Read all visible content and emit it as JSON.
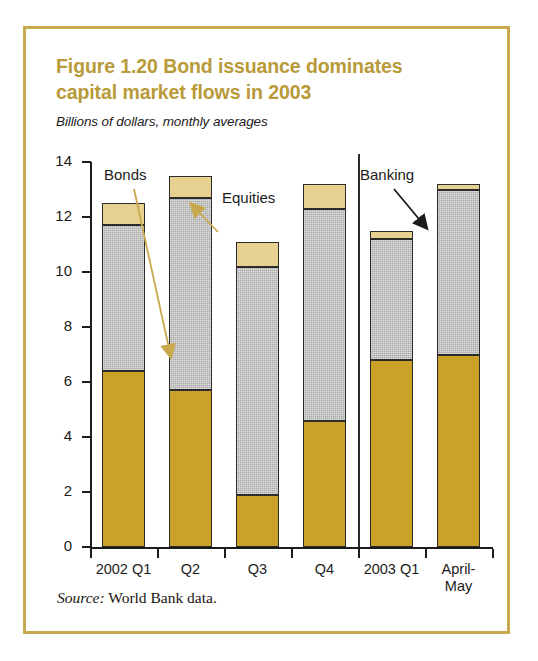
{
  "figure": {
    "title": "Figure 1.20  Bond issuance dominates capital market flows in 2003",
    "title_line1": "Figure 1.20  Bond issuance dominates",
    "title_line2": "capital market flows in 2003",
    "subtitle": "Billions of dollars, monthly averages",
    "source_label": "Source:",
    "source_text": "World Bank data."
  },
  "colors": {
    "title": "#b89a39",
    "frame": "#c8a94e",
    "bonds": "#c9a227",
    "banking": "#a9a9a9",
    "equities": "#e7d191",
    "axis": "#1b1b1b",
    "background": "#ffffff"
  },
  "annotations": [
    {
      "id": "bonds",
      "label": "Bonds",
      "target_series": "Bonds"
    },
    {
      "id": "equities",
      "label": "Equities",
      "target_series": "Equities"
    },
    {
      "id": "banking",
      "label": "Banking",
      "target_series": "Banking"
    }
  ],
  "chart_data": {
    "type": "bar",
    "subtype": "stacked-column",
    "title": "Figure 1.20  Bond issuance dominates capital market flows in 2003",
    "subtitle": "Billions of dollars, monthly averages",
    "xlabel": "",
    "ylabel": "Billions of dollars, monthly averages",
    "ylim": [
      0,
      14
    ],
    "yticks": [
      0,
      2,
      4,
      6,
      8,
      10,
      12,
      14
    ],
    "ytick_labels": [
      "0",
      "2",
      "4",
      "6",
      "8",
      "10",
      "12",
      "14"
    ],
    "grid": false,
    "legend": "annotations-with-leader-lines",
    "categories": [
      "2002 Q1",
      "Q2",
      "Q3",
      "Q4",
      "2003 Q1",
      "April-May"
    ],
    "category_labels": [
      [
        "2002 Q1"
      ],
      [
        "Q2"
      ],
      [
        "Q3"
      ],
      [
        "Q4"
      ],
      [
        "2003 Q1"
      ],
      [
        "April-",
        "May"
      ]
    ],
    "series": [
      {
        "name": "Bonds",
        "color": "#c9a227",
        "values": [
          6.4,
          5.7,
          1.9,
          4.6,
          6.8,
          7.0
        ]
      },
      {
        "name": "Banking",
        "color": "#a9a9a9",
        "values": [
          5.3,
          7.0,
          8.3,
          7.7,
          4.4,
          6.0
        ]
      },
      {
        "name": "Equities",
        "color": "#e7d191",
        "values": [
          0.8,
          0.8,
          0.9,
          0.9,
          0.3,
          0.2
        ]
      }
    ],
    "totals": [
      12.5,
      13.5,
      11.1,
      13.2,
      11.5,
      13.2
    ],
    "separator_after_category": "Q4",
    "source": "Source: World Bank data."
  }
}
